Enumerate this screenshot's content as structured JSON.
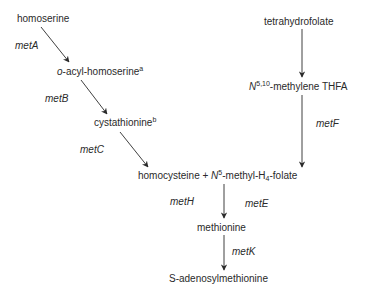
{
  "nodes": {
    "homoserine": {
      "text": "homoserine"
    },
    "o_acyl": {
      "prefix": "o",
      "text": "-acyl-homoserine",
      "sup": "a"
    },
    "cystathionine": {
      "text": "cystathionine",
      "sup": "b"
    },
    "homocysteine_pair": {
      "text1": "homocysteine + ",
      "n": "N",
      "sup": "5",
      "text2": "-methyl-H",
      "sub": "4",
      "text3": "-folate"
    },
    "thf": {
      "text": "tetrahydrofolate"
    },
    "methylene_thfa": {
      "n": "N",
      "sup": "5,10",
      "text": "-methylene THFA"
    },
    "methionine": {
      "text": "methionine"
    },
    "sam": {
      "text": "S-adenosylmethionine"
    }
  },
  "genes": {
    "metA": "metA",
    "metB": "metB",
    "metC": "metC",
    "metF": "metF",
    "metH": "metH",
    "metE": "metE",
    "metK": "metK"
  },
  "colors": {
    "line": "#2a2a2a",
    "text": "#2a2a2a"
  }
}
